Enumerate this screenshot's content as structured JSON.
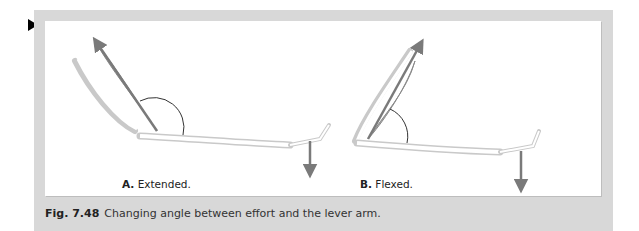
{
  "figure": {
    "number": "Fig. 7.48",
    "caption": "Changing angle between effort and the lever arm.",
    "marker_icon": "black-triangle-pointer",
    "colors": {
      "frame": "#d8d8d8",
      "panel": "#ffffff",
      "muscle": "#a9a9a9",
      "arrow": "#7a7a7a",
      "bone_outline": "#bdbdbd"
    },
    "panels": [
      {
        "id": "A",
        "letter": "A.",
        "label": "Extended."
      },
      {
        "id": "B",
        "letter": "B.",
        "label": "Flexed."
      }
    ]
  }
}
